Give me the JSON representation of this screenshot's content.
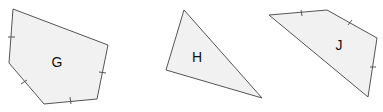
{
  "diagram": {
    "shapes": [
      {
        "id": "G",
        "label": "G",
        "type": "pentagon",
        "points": "13,9 108,45 97,99 44,104 9,63",
        "label_pos": [
          57,
          62
        ],
        "ticks": [
          {
            "x1": 8,
            "y1": 37,
            "x2": 15,
            "y2": 37
          },
          {
            "x1": 99,
            "y1": 72,
            "x2": 106,
            "y2": 73
          },
          {
            "x1": 21,
            "y1": 84,
            "x2": 27,
            "y2": 80
          },
          {
            "x1": 70,
            "y1": 97,
            "x2": 71,
            "y2": 104
          }
        ]
      },
      {
        "id": "H",
        "label": "H",
        "type": "triangle",
        "points": "184,10 166,70 262,98",
        "label_pos": [
          197,
          57
        ],
        "ticks": []
      },
      {
        "id": "J",
        "label": "J",
        "type": "quadrilateral",
        "points": "269,15 327,10 377,38 368,97",
        "label_pos": [
          339,
          45
        ],
        "ticks": [
          {
            "x1": 301,
            "y1": 10,
            "x2": 302,
            "y2": 16
          },
          {
            "x1": 348,
            "y1": 25,
            "x2": 352,
            "y2": 20
          },
          {
            "x1": 370,
            "y1": 67,
            "x2": 376,
            "y2": 67
          }
        ]
      }
    ],
    "colors": {
      "fill": "#f1f1f1",
      "stroke": "#555555",
      "label": "#111111"
    }
  }
}
